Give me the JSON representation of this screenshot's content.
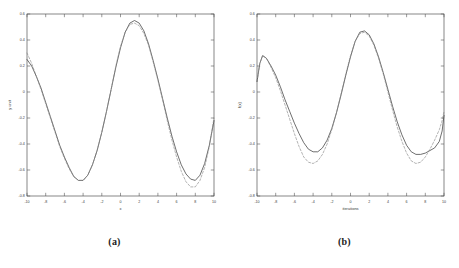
{
  "figure": {
    "background": "#ffffff",
    "panels": [
      "a",
      "b"
    ]
  },
  "panel_a": {
    "caption": "(a)"
  },
  "panel_b": {
    "caption": "(b)"
  },
  "chart_data": [
    {
      "type": "line",
      "panel": "a",
      "title": "",
      "xlabel": "x",
      "ylabel": "y unit",
      "xlim": [
        -10,
        10
      ],
      "ylim": [
        -0.8,
        0.6
      ],
      "grid": false,
      "legend": null,
      "xticks": [
        -10,
        -8,
        -6,
        -4,
        -2,
        0,
        2,
        4,
        6,
        8,
        10
      ],
      "xticklabels": [
        "-10",
        "-8",
        "-6",
        "-4",
        "-2",
        "0",
        "2",
        "4",
        "6",
        "8",
        "10"
      ],
      "yticks": [
        -0.8,
        -0.6,
        -0.4,
        -0.2,
        0,
        0.2,
        0.4,
        0.6
      ],
      "yticklabels": [
        "-0.8",
        "-0.6",
        "-0.4",
        "-0.2",
        "0",
        "0.2",
        "0.4",
        "0.6"
      ],
      "colors": {
        "solid": "#4a4a4a",
        "dashed": "#8a8a8a"
      },
      "series": [
        {
          "name": "solid",
          "style": "solid",
          "x": [
            -10,
            -9.5,
            -9,
            -8.5,
            -8,
            -7.5,
            -7,
            -6.5,
            -6,
            -5.5,
            -5,
            -4.5,
            -4,
            -3.5,
            -3,
            -2.5,
            -2,
            -1.5,
            -1,
            -0.5,
            0,
            0.5,
            1,
            1.5,
            2,
            2.5,
            3,
            3.5,
            4,
            4.5,
            5,
            5.5,
            6,
            6.5,
            7,
            7.5,
            8,
            8.5,
            9,
            9.5,
            10
          ],
          "y": [
            0.25,
            0.2,
            0.12,
            0.03,
            -0.08,
            -0.19,
            -0.3,
            -0.41,
            -0.5,
            -0.58,
            -0.65,
            -0.68,
            -0.68,
            -0.64,
            -0.56,
            -0.45,
            -0.31,
            -0.15,
            0.02,
            0.19,
            0.34,
            0.46,
            0.53,
            0.55,
            0.53,
            0.47,
            0.37,
            0.24,
            0.1,
            -0.05,
            -0.2,
            -0.34,
            -0.46,
            -0.56,
            -0.63,
            -0.67,
            -0.68,
            -0.64,
            -0.55,
            -0.41,
            -0.22
          ]
        },
        {
          "name": "dashed",
          "style": "dashed",
          "x": [
            -10,
            -9.5,
            -9,
            -8.5,
            -8,
            -7.5,
            -7,
            -6.5,
            -6,
            -5.5,
            -5,
            -4.5,
            -4,
            -3.5,
            -3,
            -2.5,
            -2,
            -1.5,
            -1,
            -0.5,
            0,
            0.5,
            1,
            1.5,
            2,
            2.5,
            3,
            3.5,
            4,
            4.5,
            5,
            5.5,
            6,
            6.5,
            7,
            7.5,
            8,
            8.5,
            9,
            9.5,
            10
          ],
          "y": [
            0.3,
            0.22,
            0.12,
            0.02,
            -0.09,
            -0.2,
            -0.31,
            -0.42,
            -0.51,
            -0.59,
            -0.65,
            -0.68,
            -0.68,
            -0.64,
            -0.56,
            -0.45,
            -0.31,
            -0.15,
            0.02,
            0.2,
            0.35,
            0.46,
            0.52,
            0.53,
            0.51,
            0.45,
            0.36,
            0.23,
            0.09,
            -0.06,
            -0.22,
            -0.37,
            -0.5,
            -0.61,
            -0.69,
            -0.73,
            -0.73,
            -0.68,
            -0.58,
            -0.42,
            -0.2
          ]
        }
      ]
    },
    {
      "type": "line",
      "panel": "b",
      "title": "",
      "xlabel": "iterations",
      "ylabel": "f(x)",
      "xlim": [
        -10,
        10
      ],
      "ylim": [
        -0.8,
        0.6
      ],
      "grid": false,
      "legend": null,
      "xticks": [
        -10,
        -8,
        -6,
        -4,
        -2,
        0,
        2,
        4,
        6,
        8,
        10
      ],
      "xticklabels": [
        "-10",
        "-8",
        "-6",
        "-4",
        "-2",
        "0",
        "2",
        "4",
        "6",
        "8",
        "10"
      ],
      "yticks": [
        -0.8,
        -0.6,
        -0.4,
        -0.2,
        0,
        0.2,
        0.4,
        0.6
      ],
      "yticklabels": [
        "-0.8",
        "-0.6",
        "-0.4",
        "-0.2",
        "0",
        "0.2",
        "0.4",
        "0.6"
      ],
      "colors": {
        "solid": "#4a4a4a",
        "dashed": "#8a8a8a"
      },
      "series": [
        {
          "name": "solid",
          "style": "solid",
          "x": [
            -10,
            -9.7,
            -9.4,
            -9,
            -8.5,
            -8,
            -7.5,
            -7,
            -6.5,
            -6,
            -5.5,
            -5,
            -4.5,
            -4,
            -3.5,
            -3,
            -2.5,
            -2,
            -1.5,
            -1,
            -0.5,
            0,
            0.5,
            1,
            1.5,
            2,
            2.5,
            3,
            3.5,
            4,
            4.5,
            5,
            5.5,
            6,
            6.5,
            7,
            7.5,
            8,
            8.5,
            9,
            9.5,
            9.8,
            10
          ],
          "y": [
            0.08,
            0.22,
            0.28,
            0.26,
            0.2,
            0.13,
            0.04,
            -0.06,
            -0.15,
            -0.24,
            -0.32,
            -0.39,
            -0.44,
            -0.46,
            -0.46,
            -0.43,
            -0.37,
            -0.28,
            -0.16,
            -0.02,
            0.13,
            0.27,
            0.39,
            0.46,
            0.47,
            0.44,
            0.37,
            0.27,
            0.15,
            0.02,
            -0.11,
            -0.23,
            -0.33,
            -0.41,
            -0.46,
            -0.48,
            -0.48,
            -0.47,
            -0.45,
            -0.43,
            -0.38,
            -0.3,
            -0.18
          ]
        },
        {
          "name": "dashed",
          "style": "dashed",
          "x": [
            -10,
            -9.7,
            -9.4,
            -9,
            -8.5,
            -8,
            -7.5,
            -7,
            -6.5,
            -6,
            -5.5,
            -5,
            -4.5,
            -4,
            -3.5,
            -3,
            -2.5,
            -2,
            -1.5,
            -1,
            -0.5,
            0,
            0.5,
            1,
            1.5,
            2,
            2.5,
            3,
            3.5,
            4,
            4.5,
            5,
            5.5,
            6,
            6.5,
            7,
            7.5,
            8,
            8.5,
            9,
            9.5,
            9.8,
            10
          ],
          "y": [
            0.08,
            0.22,
            0.28,
            0.26,
            0.19,
            0.11,
            0.01,
            -0.1,
            -0.21,
            -0.32,
            -0.42,
            -0.5,
            -0.54,
            -0.55,
            -0.53,
            -0.48,
            -0.4,
            -0.29,
            -0.16,
            -0.01,
            0.14,
            0.28,
            0.39,
            0.45,
            0.46,
            0.43,
            0.36,
            0.26,
            0.14,
            0.0,
            -0.14,
            -0.27,
            -0.38,
            -0.47,
            -0.53,
            -0.55,
            -0.54,
            -0.5,
            -0.44,
            -0.37,
            -0.29,
            -0.22,
            -0.15
          ]
        }
      ]
    }
  ]
}
